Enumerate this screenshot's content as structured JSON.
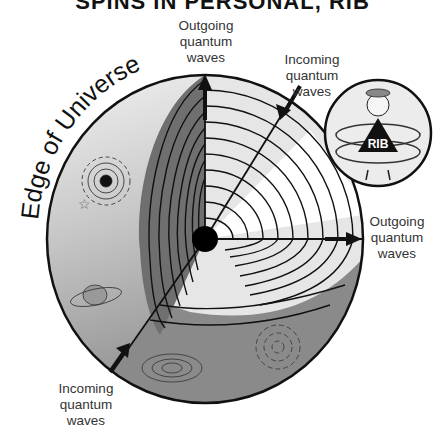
{
  "title": "SPINS IN PERSONAL, RIB",
  "edge_label": "Edge of Universe",
  "labels": {
    "top_outgoing": [
      "Outgoing",
      "quantum",
      "waves"
    ],
    "top_incoming": [
      "Incoming",
      "quantum",
      "waves"
    ],
    "right_outgoing": [
      "Outgoing",
      "quantum",
      "waves"
    ],
    "bottom_incoming": [
      "Incoming",
      "quantum",
      "waves"
    ]
  },
  "inset": {
    "badge_text": "RIB"
  },
  "colors": {
    "outer_light": "#d6d6d6",
    "outer_dark": "#8a8a8a",
    "cut_face": "#e8e8e8",
    "cut_band_dark": "#6f6f6f",
    "white_wedge": "#ffffff",
    "line": "#111111"
  }
}
